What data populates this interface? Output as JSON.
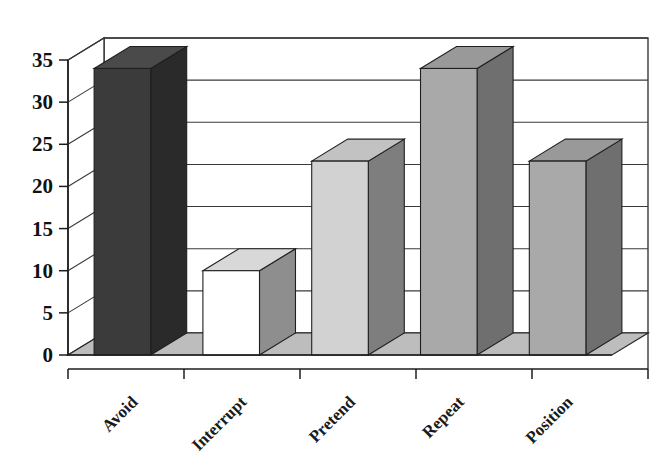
{
  "chart_data": {
    "type": "bar",
    "title": "",
    "subtitle": "",
    "xlabel": "",
    "ylabel": "",
    "categories": [
      "Avoid",
      "Interrupt",
      "Pretend",
      "Repeat",
      "Position"
    ],
    "values": [
      34,
      10,
      23,
      34,
      23
    ],
    "series": [
      {
        "name": "",
        "values": [
          34,
          10,
          23,
          34,
          23
        ]
      }
    ],
    "ylim": [
      0,
      35
    ],
    "ytick_labels": [
      "0",
      "5",
      "10",
      "15",
      "20",
      "25",
      "30",
      "35"
    ],
    "ytick_values": [
      0,
      5,
      10,
      15,
      20,
      25,
      30,
      35
    ],
    "grid": true,
    "grid_axis": "y",
    "legend": false,
    "legend_position": "none",
    "style": "3d-column",
    "bar_colors": [
      "#3b3b3b",
      "#ffffff",
      "#d2d2d2",
      "#a9a9a9",
      "#a9a9a9"
    ],
    "bar_top_colors": [
      "#4a4a4a",
      "#d8d8d8",
      "#c2c2c2",
      "#999999",
      "#999999"
    ],
    "bar_side_colors": [
      "#2a2a2a",
      "#8e8e8e",
      "#7e7e7e",
      "#6f6f6f",
      "#6f6f6f"
    ],
    "annotations": [],
    "data_labels": false,
    "background_color": "#ffffff",
    "floor_color": "#bdbdbd",
    "axis_color": "#1c1c1c"
  },
  "axes": {
    "y_axis_name": "value-axis",
    "x_axis_name": "category-axis"
  }
}
